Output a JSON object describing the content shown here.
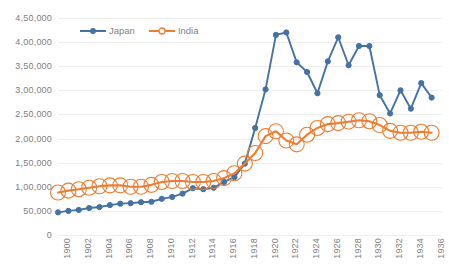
{
  "chart_data": {
    "type": "line",
    "title": "",
    "subtitle": "",
    "xlabel": "",
    "ylabel": "",
    "x": [
      1900,
      1901,
      1902,
      1903,
      1904,
      1905,
      1906,
      1907,
      1908,
      1909,
      1910,
      1911,
      1912,
      1913,
      1914,
      1915,
      1916,
      1917,
      1918,
      1919,
      1920,
      1921,
      1922,
      1923,
      1924,
      1925,
      1926,
      1927,
      1928,
      1929,
      1930,
      1931,
      1932,
      1933,
      1934,
      1935,
      1936,
      1937
    ],
    "xlim": [
      1900,
      1937
    ],
    "ylim": [
      0,
      450000
    ],
    "ytick_values": [
      0,
      50000,
      100000,
      150000,
      200000,
      250000,
      300000,
      350000,
      400000,
      450000
    ],
    "ytick_labels": [
      "0",
      "50,000",
      "1,00,000",
      "1,50,000",
      "2,00,000",
      "2,50,000",
      "3,00,000",
      "3,50,000",
      "4,00,000",
      "4,50,000"
    ],
    "xtick_values": [
      1900,
      1902,
      1904,
      1906,
      1908,
      1910,
      1912,
      1914,
      1916,
      1918,
      1920,
      1922,
      1924,
      1926,
      1928,
      1930,
      1932,
      1934,
      1936
    ],
    "xtick_labels": [
      "1900",
      "1902",
      "1904",
      "1906",
      "1908",
      "1910",
      "1912",
      "1914",
      "1916",
      "1918",
      "1920",
      "1922",
      "1924",
      "1926",
      "1928",
      "1930",
      "1932",
      "1934",
      "1936"
    ],
    "grid": true,
    "grid_axis": "y",
    "legend_position": "top-left",
    "series": [
      {
        "name": "Japan",
        "color": "#4472A4",
        "marker": "filled-circle",
        "values": [
          47000,
          50000,
          52000,
          56000,
          58000,
          62000,
          65000,
          66000,
          68000,
          69000,
          75000,
          79000,
          86000,
          97000,
          95000,
          98000,
          110000,
          120000,
          148000,
          222000,
          302000,
          415000,
          420000,
          358000,
          338000,
          294000,
          360000,
          410000,
          352000,
          392000,
          392000,
          290000,
          252000,
          300000,
          262000,
          315000,
          285000,
          null
        ]
      },
      {
        "name": "India",
        "color": "#ED7D31",
        "marker": "open-circle",
        "values": [
          88000,
          92000,
          95000,
          98000,
          101000,
          103000,
          103000,
          100000,
          100000,
          104000,
          110000,
          112000,
          112000,
          110000,
          110000,
          112000,
          118000,
          128000,
          148000,
          170000,
          205000,
          215000,
          196000,
          188000,
          208000,
          222000,
          230000,
          232000,
          235000,
          238000,
          236000,
          228000,
          216000,
          212000,
          212000,
          214000,
          212000,
          null
        ]
      }
    ]
  },
  "legend": {
    "items": [
      {
        "label": "Japan",
        "color": "#4472A4"
      },
      {
        "label": "India",
        "color": "#ED7D31"
      }
    ]
  },
  "colors": {
    "japan": "#4472A4",
    "india": "#ED7D31",
    "gridline": "#efefef",
    "tick_text": "#808080",
    "background": "#ffffff"
  }
}
